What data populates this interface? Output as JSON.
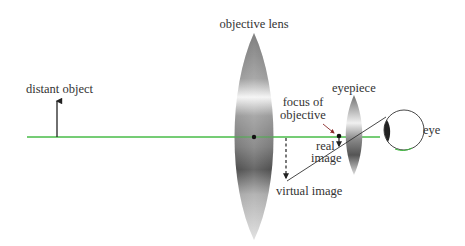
{
  "diagram": {
    "labels": {
      "objective_lens": "objective lens",
      "distant_object": "distant object",
      "eyepiece": "eyepiece",
      "focus_line1": "focus of",
      "focus_line2": "objective",
      "real_line1": "real",
      "real_line2": "image",
      "virtual_image": "virtual image",
      "eye": "eye"
    },
    "colors": {
      "optical_axis": "#3cb83c",
      "ink": "#222222",
      "lens_dark": "#555555",
      "lens_light": "#f2f2f2"
    }
  }
}
